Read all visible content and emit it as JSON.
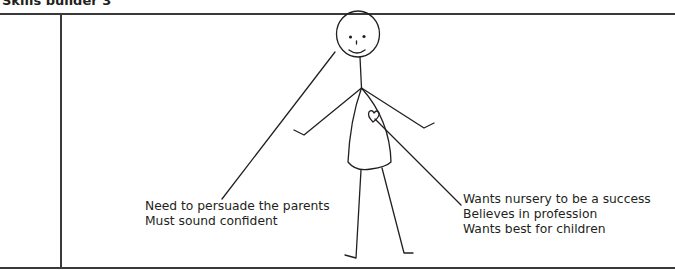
{
  "header": {
    "title": "Skills builder 3"
  },
  "diagram": {
    "left_annotation": [
      "Need to persuade the parents",
      "Must sound confident"
    ],
    "right_annotation": [
      "Wants nursery to be a success",
      "Believes in profession",
      "Wants best for children"
    ],
    "colors": {
      "line": "#231f20",
      "rule": "#3a3a3a",
      "background": "#ffffff"
    }
  }
}
